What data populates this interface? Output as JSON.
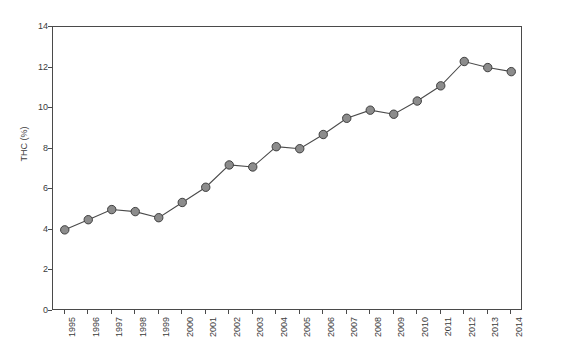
{
  "top_caption": "",
  "chart_data": {
    "type": "line",
    "title": "",
    "xlabel": "",
    "ylabel": "THC (%)",
    "categories": [
      "1995",
      "1996",
      "1997",
      "1998",
      "1999",
      "2000",
      "2001",
      "2002",
      "2003",
      "2004",
      "2005",
      "2006",
      "2007",
      "2008",
      "2009",
      "2010",
      "2011",
      "2012",
      "2013",
      "2014"
    ],
    "values": [
      4.0,
      4.5,
      5.0,
      4.9,
      4.6,
      5.35,
      6.1,
      7.2,
      7.1,
      8.1,
      8.0,
      8.7,
      9.5,
      9.9,
      9.7,
      10.35,
      11.1,
      12.3,
      12.0,
      11.8
    ],
    "ylim": [
      0,
      14
    ],
    "y_ticks": [
      0,
      2,
      4,
      6,
      8,
      10,
      12,
      14
    ],
    "grid": false,
    "legend": "none",
    "series": [
      {
        "name": "THC (%)",
        "marker": "circle",
        "marker_fill": "#8c8c8c",
        "marker_edge": "#3f3f3f",
        "line_color": "#4a4a4a"
      }
    ]
  },
  "axis": {
    "frame_color": "#4a4a4a",
    "tick_color": "#4a4a4a",
    "tick_label_color": "#3b3b3b"
  }
}
